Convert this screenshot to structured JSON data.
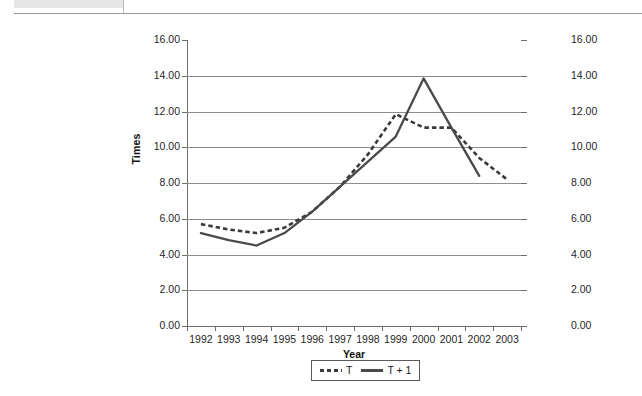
{
  "chart_data": {
    "type": "line",
    "title": "",
    "xlabel": "Year",
    "ylabel": "Times",
    "categories": [
      "1992",
      "1993",
      "1994",
      "1995",
      "1996",
      "1997",
      "1998",
      "1999",
      "2000",
      "2001",
      "2002",
      "2003"
    ],
    "ylim": [
      0,
      16
    ],
    "ytick_step": 2,
    "yticks": [
      "0.00",
      "2.00",
      "4.00",
      "6.00",
      "8.00",
      "10.00",
      "12.00",
      "14.00",
      "16.00"
    ],
    "yticks_right": [
      "0.00",
      "2.00",
      "4.00",
      "6.00",
      "8.00",
      "10.00",
      "12.00",
      "14.00",
      "16.00"
    ],
    "grid": true,
    "dual_axis": true,
    "legend_position": "bottom-center",
    "series": [
      {
        "name": "T",
        "style": "dashed",
        "color": "#3a3a3a",
        "values": [
          5.7,
          5.4,
          5.2,
          5.5,
          6.4,
          7.8,
          9.6,
          11.85,
          11.1,
          11.1,
          9.4,
          8.2
        ]
      },
      {
        "name": "T + 1",
        "style": "solid",
        "color": "#4a4a4a",
        "values": [
          5.2,
          4.8,
          4.5,
          5.2,
          6.4,
          7.8,
          9.2,
          10.6,
          13.85,
          11.1,
          8.4,
          null
        ]
      }
    ]
  },
  "axes": {
    "y_title": "Times",
    "x_title": "Year"
  },
  "legend": {
    "items": [
      {
        "label": "T",
        "style": "dashed"
      },
      {
        "label": "T + 1",
        "style": "solid"
      }
    ]
  }
}
